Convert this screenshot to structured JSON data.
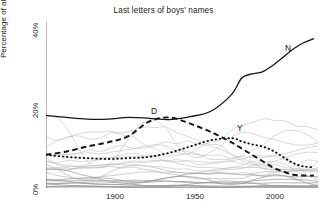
{
  "chart_data": {
    "type": "line",
    "title": "Last letters of boys' names",
    "xlabel": "",
    "ylabel": "Percentage of all boys' names that year",
    "xlim": [
      1880,
      2012
    ],
    "ylim": [
      0,
      40
    ],
    "xticks": [
      "1900",
      "1950",
      "2000"
    ],
    "yticks": [
      "0%",
      "20%",
      "40%"
    ],
    "grid": false,
    "legend": "inline-annotations",
    "x": [
      1880,
      1890,
      1900,
      1910,
      1920,
      1930,
      1940,
      1950,
      1960,
      1970,
      1975,
      1980,
      1985,
      1990,
      1995,
      2000,
      2005,
      2010
    ],
    "series": [
      {
        "name": "N",
        "label": "N",
        "style": "solid",
        "values": [
          17.5,
          17.0,
          16.6,
          16.6,
          17.0,
          16.8,
          16.5,
          17.2,
          18.5,
          22.5,
          26.5,
          27.5,
          28.0,
          29.5,
          31.5,
          33.5,
          35.0,
          36.0
        ]
      },
      {
        "name": "D",
        "label": "D",
        "style": "dashed",
        "values": [
          8.0,
          8.8,
          10.0,
          11.0,
          12.5,
          16.0,
          17.0,
          15.5,
          13.5,
          11.0,
          9.5,
          8.0,
          6.5,
          5.0,
          4.0,
          3.2,
          3.0,
          3.0
        ]
      },
      {
        "name": "Y",
        "label": "Y",
        "style": "dotted",
        "values": [
          8.0,
          7.5,
          7.2,
          7.0,
          7.2,
          7.5,
          8.5,
          10.0,
          11.5,
          12.0,
          11.2,
          10.5,
          10.0,
          9.0,
          7.5,
          6.0,
          5.2,
          5.0
        ]
      }
    ],
    "other_letters_note": "approximately 20 additional faint gray series for the remaining letters"
  },
  "annotations": {
    "n_label": "N",
    "d_label": "D",
    "y_label": "Y"
  }
}
